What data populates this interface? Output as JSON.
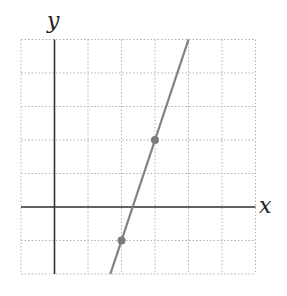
{
  "chart_data": {
    "type": "line",
    "title": "",
    "xlabel": "x",
    "ylabel": "y",
    "xlim": [
      -1,
      6
    ],
    "ylim": [
      -2,
      5
    ],
    "grid": true,
    "grid_style": "dotted",
    "series": [
      {
        "name": "line",
        "equation": "y = 3x - 7",
        "x": [
          1.667,
          4
        ],
        "y": [
          -2,
          5
        ],
        "color": "#808080"
      }
    ],
    "points": [
      {
        "x": 2,
        "y": -1
      },
      {
        "x": 3,
        "y": 2
      }
    ],
    "colors": {
      "grid": "#b0b0b0",
      "axis": "#333333",
      "line": "#808080",
      "point": "#7a7a7a"
    }
  }
}
